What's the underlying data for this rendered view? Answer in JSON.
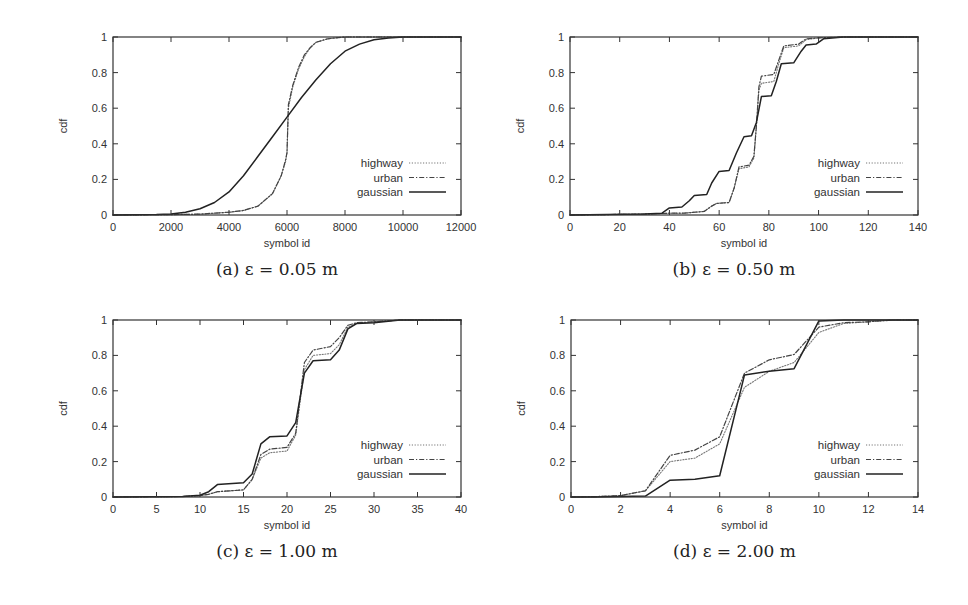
{
  "figure": {
    "panels": [
      {
        "id": "a",
        "caption": "(a) ε = 0.05 m"
      },
      {
        "id": "b",
        "caption": "(b) ε = 0.50 m"
      },
      {
        "id": "c",
        "caption": "(c) ε = 1.00 m"
      },
      {
        "id": "d",
        "caption": "(d) ε = 2.00 m"
      }
    ],
    "legend": [
      "highway",
      "urban",
      "gaussian"
    ],
    "colors": {
      "axis": "#333333",
      "highway": "#777777",
      "urban": "#444444",
      "gaussian": "#222222"
    }
  },
  "chart_data": [
    {
      "type": "line",
      "title": "(a) ε = 0.05 m",
      "xlabel": "symbol id",
      "ylabel": "cdf",
      "xlim": [
        0,
        12000
      ],
      "ylim": [
        0,
        1
      ],
      "xticks": [
        0,
        2000,
        4000,
        6000,
        8000,
        10000,
        12000
      ],
      "yticks": [
        0,
        0.2,
        0.4,
        0.6,
        0.8,
        1
      ],
      "legend_position": "lower right",
      "grid": false,
      "series": [
        {
          "name": "highway",
          "style": "dotted",
          "x": [
            0,
            2000,
            3000,
            4000,
            4500,
            5000,
            5500,
            5800,
            5950,
            6000,
            6050,
            6200,
            6400,
            6600,
            6800,
            7000,
            7400,
            8000,
            9000,
            12000
          ],
          "y": [
            0,
            0.002,
            0.005,
            0.015,
            0.025,
            0.05,
            0.12,
            0.22,
            0.3,
            0.35,
            0.6,
            0.72,
            0.82,
            0.89,
            0.94,
            0.97,
            0.99,
            1.0,
            1.0,
            1.0
          ]
        },
        {
          "name": "urban",
          "style": "dashdot",
          "x": [
            0,
            2000,
            3000,
            4000,
            4500,
            5000,
            5500,
            5800,
            5950,
            6000,
            6050,
            6200,
            6400,
            6600,
            6800,
            7000,
            7400,
            8000,
            9000,
            12000
          ],
          "y": [
            0,
            0.002,
            0.005,
            0.016,
            0.026,
            0.05,
            0.12,
            0.22,
            0.31,
            0.35,
            0.62,
            0.73,
            0.83,
            0.9,
            0.94,
            0.97,
            0.99,
            1.0,
            1.0,
            1.0
          ]
        },
        {
          "name": "gaussian",
          "style": "solid",
          "x": [
            0,
            1500,
            2000,
            2500,
            3000,
            3500,
            4000,
            4500,
            5000,
            5500,
            6000,
            6500,
            7000,
            7500,
            8000,
            8500,
            9000,
            9500,
            10000,
            12000
          ],
          "y": [
            0,
            0.002,
            0.006,
            0.015,
            0.035,
            0.07,
            0.13,
            0.22,
            0.33,
            0.44,
            0.55,
            0.66,
            0.76,
            0.85,
            0.92,
            0.96,
            0.985,
            0.995,
            1.0,
            1.0
          ]
        }
      ]
    },
    {
      "type": "line",
      "title": "(b) ε = 0.50 m",
      "xlabel": "symbol id",
      "ylabel": "cdf",
      "xlim": [
        0,
        140
      ],
      "ylim": [
        0,
        1
      ],
      "xticks": [
        0,
        20,
        40,
        60,
        80,
        100,
        120,
        140
      ],
      "yticks": [
        0,
        0.2,
        0.4,
        0.6,
        0.8,
        1
      ],
      "legend_position": "lower right",
      "grid": false,
      "series": [
        {
          "name": "highway",
          "style": "dotted",
          "x": [
            0,
            30,
            40,
            46,
            54,
            57,
            59,
            64,
            66,
            68,
            72,
            74,
            75,
            76,
            77,
            82,
            84,
            86,
            92,
            95,
            100,
            110,
            140
          ],
          "y": [
            0,
            0.005,
            0.01,
            0.01,
            0.02,
            0.05,
            0.065,
            0.07,
            0.15,
            0.26,
            0.27,
            0.32,
            0.5,
            0.7,
            0.74,
            0.75,
            0.85,
            0.94,
            0.95,
            0.985,
            0.995,
            1.0,
            1.0
          ]
        },
        {
          "name": "urban",
          "style": "dashdot",
          "x": [
            0,
            30,
            40,
            46,
            54,
            57,
            59,
            64,
            66,
            68,
            72,
            74,
            75,
            76,
            77,
            82,
            84,
            86,
            92,
            95,
            100,
            110,
            140
          ],
          "y": [
            0,
            0.005,
            0.01,
            0.01,
            0.02,
            0.05,
            0.065,
            0.07,
            0.15,
            0.27,
            0.28,
            0.33,
            0.5,
            0.72,
            0.78,
            0.79,
            0.87,
            0.95,
            0.96,
            0.99,
            0.995,
            1.0,
            1.0
          ]
        },
        {
          "name": "gaussian",
          "style": "solid",
          "x": [
            0,
            30,
            37,
            40,
            45,
            48,
            50,
            55,
            57,
            60,
            64,
            67,
            70,
            73,
            75,
            77,
            81,
            83,
            85,
            90,
            93,
            95,
            99,
            102,
            110,
            140
          ],
          "y": [
            0,
            0.005,
            0.01,
            0.04,
            0.045,
            0.08,
            0.11,
            0.115,
            0.18,
            0.245,
            0.25,
            0.35,
            0.44,
            0.445,
            0.52,
            0.665,
            0.67,
            0.75,
            0.85,
            0.855,
            0.92,
            0.955,
            0.96,
            0.99,
            1.0,
            1.0
          ]
        }
      ]
    },
    {
      "type": "line",
      "title": "(c) ε = 1.00 m",
      "xlabel": "symbol id",
      "ylabel": "cdf",
      "xlim": [
        0,
        40
      ],
      "ylim": [
        0,
        1
      ],
      "xticks": [
        0,
        5,
        10,
        15,
        20,
        25,
        30,
        35,
        40
      ],
      "yticks": [
        0,
        0.2,
        0.4,
        0.6,
        0.8,
        1
      ],
      "legend_position": "lower right",
      "grid": false,
      "series": [
        {
          "name": "highway",
          "style": "dotted",
          "x": [
            0,
            8,
            10,
            11,
            12,
            15,
            16,
            17,
            18,
            20,
            21,
            22,
            23,
            25,
            26,
            27,
            28,
            30,
            33,
            40
          ],
          "y": [
            0,
            0.003,
            0.008,
            0.015,
            0.03,
            0.04,
            0.1,
            0.22,
            0.25,
            0.26,
            0.35,
            0.72,
            0.8,
            0.81,
            0.86,
            0.96,
            0.98,
            0.99,
            1.0,
            1.0
          ]
        },
        {
          "name": "urban",
          "style": "dashdot",
          "x": [
            0,
            8,
            10,
            11,
            12,
            15,
            16,
            17,
            18,
            20,
            21,
            22,
            23,
            25,
            26,
            27,
            28,
            30,
            33,
            40
          ],
          "y": [
            0,
            0.003,
            0.008,
            0.015,
            0.03,
            0.04,
            0.1,
            0.24,
            0.27,
            0.28,
            0.36,
            0.76,
            0.83,
            0.85,
            0.9,
            0.97,
            0.985,
            0.99,
            1.0,
            1.0
          ]
        },
        {
          "name": "gaussian",
          "style": "solid",
          "x": [
            0,
            8,
            10,
            11,
            12,
            15,
            16,
            17,
            18,
            20,
            21,
            22,
            23,
            25,
            26,
            27,
            28,
            30,
            33,
            40
          ],
          "y": [
            0,
            0.003,
            0.01,
            0.03,
            0.07,
            0.08,
            0.13,
            0.3,
            0.34,
            0.345,
            0.42,
            0.7,
            0.77,
            0.775,
            0.83,
            0.95,
            0.98,
            0.985,
            1.0,
            1.0
          ]
        }
      ]
    },
    {
      "type": "line",
      "title": "(d) ε = 2.00 m",
      "xlabel": "symbol id",
      "ylabel": "cdf",
      "xlim": [
        0,
        14
      ],
      "ylim": [
        0,
        1
      ],
      "xticks": [
        0,
        2,
        4,
        6,
        8,
        10,
        12,
        14
      ],
      "yticks": [
        0,
        0.2,
        0.4,
        0.6,
        0.8,
        1
      ],
      "legend_position": "lower right",
      "grid": false,
      "series": [
        {
          "name": "highway",
          "style": "dotted",
          "x": [
            0,
            1,
            2,
            3,
            4,
            5,
            6,
            7,
            8,
            9,
            10,
            11,
            12,
            13,
            14
          ],
          "y": [
            0,
            0.002,
            0.008,
            0.035,
            0.2,
            0.22,
            0.3,
            0.62,
            0.71,
            0.76,
            0.93,
            0.98,
            0.99,
            1.0,
            1.0
          ]
        },
        {
          "name": "urban",
          "style": "dashdot",
          "x": [
            0,
            1,
            2,
            3,
            4,
            5,
            6,
            7,
            8,
            9,
            10,
            11,
            12,
            13,
            14
          ],
          "y": [
            0,
            0.002,
            0.008,
            0.035,
            0.235,
            0.265,
            0.34,
            0.7,
            0.775,
            0.805,
            0.96,
            0.985,
            0.99,
            1.0,
            1.0
          ]
        },
        {
          "name": "gaussian",
          "style": "solid",
          "x": [
            0,
            1,
            2,
            3,
            4,
            5,
            6,
            7,
            8,
            9,
            10,
            11,
            12,
            13,
            14
          ],
          "y": [
            0,
            0.0,
            0.002,
            0.005,
            0.095,
            0.1,
            0.12,
            0.69,
            0.71,
            0.725,
            0.995,
            1.0,
            1.0,
            1.0,
            1.0
          ]
        }
      ]
    }
  ]
}
